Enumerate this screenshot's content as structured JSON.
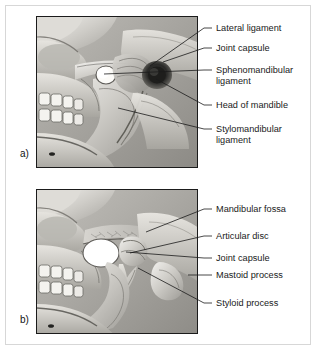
{
  "figure": {
    "type": "anatomical-illustration",
    "background_color": "#ffffff",
    "frame_color": "#d7d7d7",
    "art_border_color": "#1b1b1b",
    "text_color": "#1a1a1a",
    "leader_color": "#1a1a1a"
  },
  "panels": [
    {
      "letter": "a)",
      "name": "panel-a",
      "description": "Lateral view of skull and mandible showing the ligaments of the temporomandibular joint",
      "labels": [
        {
          "text": "Lateral ligament",
          "name": "label-lateral-ligament"
        },
        {
          "text": "Joint capsule",
          "name": "label-joint-capsule"
        },
        {
          "text": "Sphenomandibular\nligament",
          "name": "label-sphenomandibular-ligament"
        },
        {
          "text": "Head of mandible",
          "name": "label-head-of-mandible"
        },
        {
          "text": "Stylomandibular\nligament",
          "name": "label-stylomandibular-ligament"
        }
      ]
    },
    {
      "letter": "b)",
      "name": "panel-b",
      "description": "Sagittal section of the temporomandibular joint showing the articular disc and bony landmarks",
      "labels": [
        {
          "text": "Mandibular fossa",
          "name": "label-mandibular-fossa"
        },
        {
          "text": "Articular disc",
          "name": "label-articular-disc"
        },
        {
          "text": "Joint capsule",
          "name": "label-joint-capsule-b"
        },
        {
          "text": "Mastoid process",
          "name": "label-mastoid-process"
        },
        {
          "text": "Styloid process",
          "name": "label-styloid-process"
        }
      ]
    }
  ]
}
